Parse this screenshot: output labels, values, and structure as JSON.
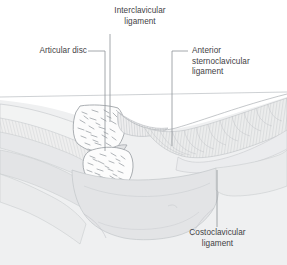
{
  "figure": {
    "kind": "anatomical-illustration",
    "background_color": "#ffffff",
    "line_color": "#9aa0a6",
    "text_color": "#3f4144",
    "bone_fill": "#fbfbfb",
    "cartilage_fill": "#e9eaec",
    "soft_tissue_fill": "#e4e5e7",
    "trabecula_color": "#a9adb2"
  },
  "labels": {
    "interclavicular": {
      "line1": "Interclavicular",
      "line2": "ligament"
    },
    "articular_disc": {
      "line1": "Articular disc"
    },
    "anterior_sternoclavicular": {
      "line1": "Anterior",
      "line2": "sternoclavicular",
      "line3": "ligament"
    },
    "costoclavicular": {
      "line1": "Costoclavicular",
      "line2": "ligament"
    }
  },
  "leaders": {
    "interclavicular": {
      "type": "vertical",
      "x": 110,
      "y_top": 34,
      "y_bottom": 122
    },
    "articular_disc": {
      "type": "elbow",
      "x_text_end": 88,
      "x_corner": 105,
      "y_horizontal": 51,
      "y_bottom": 151
    },
    "anterior_sternoclavicular": {
      "type": "elbow",
      "x_text_start": 188,
      "x_corner": 172,
      "y_horizontal": 51,
      "y_bottom": 146
    },
    "costoclavicular": {
      "type": "vertical",
      "x": 217,
      "y_top": 170,
      "y_bottom": 227
    }
  }
}
